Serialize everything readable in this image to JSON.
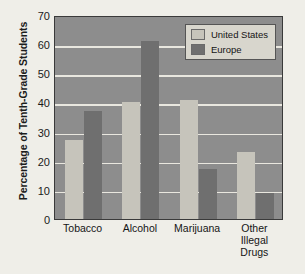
{
  "chart_data": {
    "type": "bar",
    "title": "",
    "subtitle": "",
    "xlabel": "",
    "ylabel": "Percentage of Tenth-Grade Students",
    "categories": [
      "Tobacco",
      "Alcohol",
      "Marijuana",
      "Other Illegal\nDrugs"
    ],
    "series": [
      {
        "name": "United States",
        "color": "#c6c4bb",
        "values": [
          27,
          40,
          41,
          23
        ]
      },
      {
        "name": "Europe",
        "color": "#6f6f6f",
        "values": [
          37,
          61,
          17,
          9
        ]
      }
    ],
    "ylim": [
      0,
      70
    ],
    "yticks": [
      0,
      10,
      20,
      30,
      40,
      50,
      60,
      70
    ],
    "ytick_labels": [
      "0",
      "10",
      "20",
      "30",
      "40",
      "50",
      "60",
      "70"
    ],
    "grid": true,
    "grid_axis": "y",
    "grid_color": "#e9e7df",
    "legend_position": "top-right",
    "plot_background": "#8d8d8d",
    "figure_background": "#efeee8",
    "axis_color": "#3a3a3a"
  }
}
